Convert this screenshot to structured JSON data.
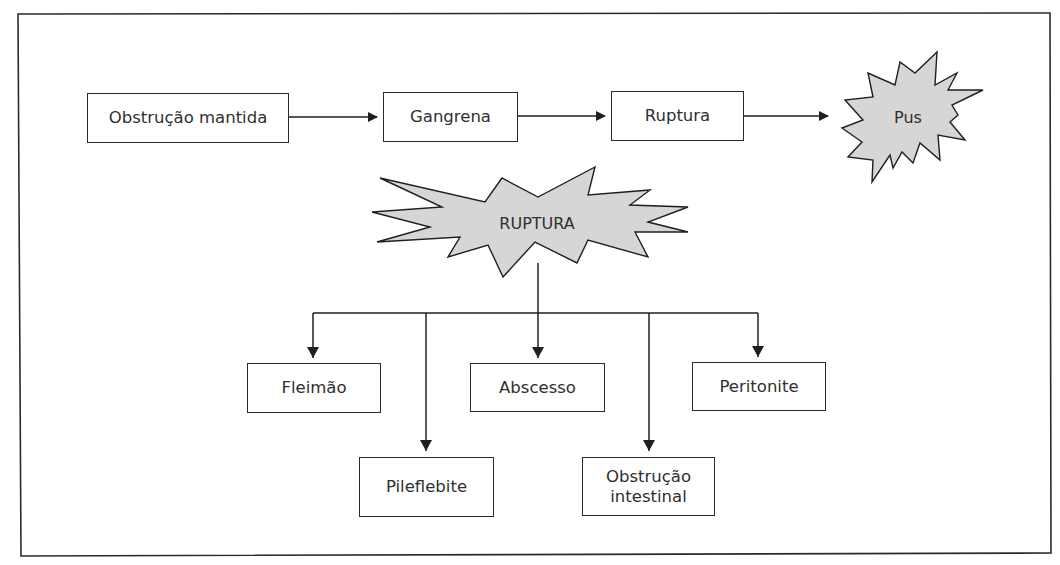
{
  "diagram": {
    "colors": {
      "line": "#1f1f1f",
      "starburst_fill": "#d6d6d6",
      "box_fill": "#ffffff",
      "text": "#2f2f2f"
    },
    "top_chain": {
      "nodes": [
        {
          "id": "obstrucao-mantida",
          "label": "Obstrução mantida",
          "shape": "box"
        },
        {
          "id": "gangrena",
          "label": "Gangrena",
          "shape": "box"
        },
        {
          "id": "ruptura",
          "label": "Ruptura",
          "shape": "box"
        },
        {
          "id": "pus",
          "label": "Pus",
          "shape": "starburst"
        }
      ],
      "edges": [
        [
          "obstrucao-mantida",
          "gangrena"
        ],
        [
          "gangrena",
          "ruptura"
        ],
        [
          "ruptura",
          "pus"
        ]
      ]
    },
    "rupture_tree": {
      "root": {
        "id": "ruptura-root",
        "label": "RUPTURA",
        "shape": "starburst"
      },
      "children": [
        {
          "id": "fleimao",
          "label": "Fleimão",
          "row": 1
        },
        {
          "id": "pileflebite",
          "label": "Pileflebite",
          "row": 2
        },
        {
          "id": "abscesso",
          "label": "Abscesso",
          "row": 1
        },
        {
          "id": "obstrucao-intestinal",
          "label": "Obstrução\nintestinal",
          "row": 2
        },
        {
          "id": "peritonite",
          "label": "Peritonite",
          "row": 1
        }
      ]
    }
  }
}
